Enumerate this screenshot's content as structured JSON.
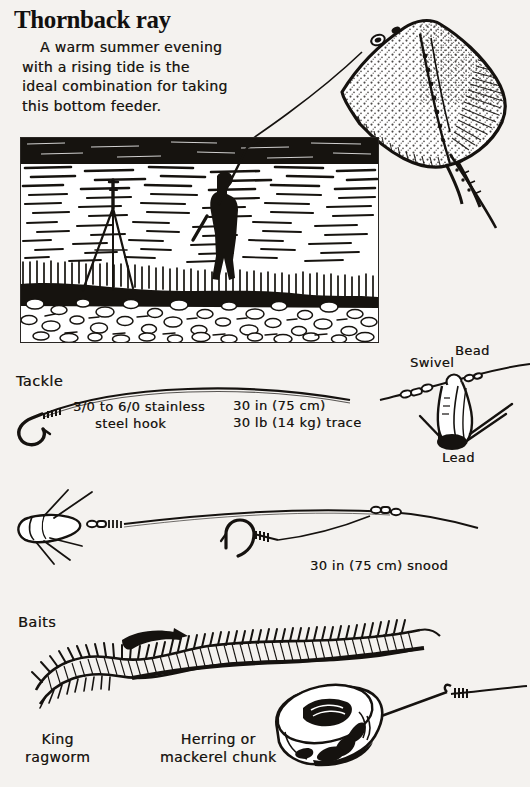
{
  "page": {
    "title": "Thornback ray",
    "background_color": "#f4f2ef",
    "ink_color": "#15120f",
    "intro_paragraph": "A warm summer evening with a rising tide is the ideal combination for taking this bottom feeder.",
    "intro_lines": [
      "A warm summer evening",
      "with a rising tide is the",
      "ideal combination for taking",
      "this bottom feeder."
    ]
  },
  "scene": {
    "name": "beach-fishing-scene",
    "elements": [
      "sea",
      "angler-casting",
      "rod-rest-tripod",
      "shingle-beach",
      "groyne"
    ]
  },
  "fish": {
    "name": "thornback-ray",
    "description": "speckled diamond-shaped ray with long spiny tail"
  },
  "sections": {
    "tackle": {
      "label": "Tackle",
      "callouts": {
        "hook": "3/0 to 6/0 stainless\nsteel hook",
        "hook_line_1": "3/0 to 6/0 stainless",
        "hook_line_2": "steel hook",
        "trace_line_1": "30 in (75 cm)",
        "trace_line_2": "30 lb (14 kg) trace",
        "swivel": "Swivel",
        "bead": "Bead",
        "lead": "Lead",
        "snood": "30 in (75 cm) snood"
      }
    },
    "baits": {
      "label": "Baits",
      "items": [
        {
          "name": "king-ragworm",
          "line_1": "King",
          "line_2": "ragworm"
        },
        {
          "name": "mackerel-chunk",
          "line_1": "Herring or",
          "line_2": "mackerel chunk"
        }
      ]
    }
  }
}
